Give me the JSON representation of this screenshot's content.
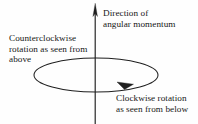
{
  "figure": {
    "name": "angular-momentum-right-hand-rule-diagram",
    "background_color": "#fefefe",
    "stroke_color": "#1f1f1f",
    "text_color": "#171717",
    "width": 198,
    "height": 124
  },
  "axis": {
    "label_line_1": "Direction of",
    "label_line_2": "angular momentum",
    "orientation": "vertical",
    "arrow_direction": "up",
    "x_position": 95,
    "top_y": 4,
    "bottom_y": 124
  },
  "loop": {
    "shape": "ellipse",
    "center_x": 96,
    "center_y": 75,
    "radius_x": 62,
    "radius_y": 17,
    "arrow_direction": "rightward-along-front-edge"
  },
  "captions": {
    "counterclockwise": {
      "line_1": "Counterclockwise",
      "line_2": "rotation as seen from",
      "line_3": "above"
    },
    "clockwise": {
      "line_1": "Clockwise rotation",
      "line_2": "as seen from below"
    }
  }
}
